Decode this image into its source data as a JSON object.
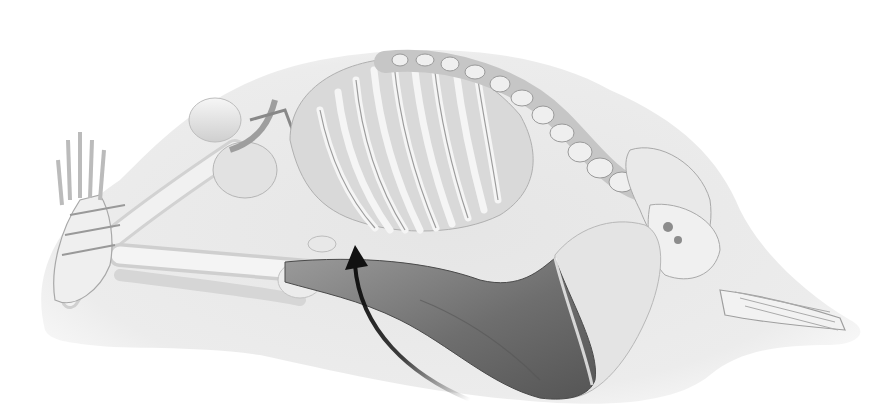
{
  "illustration": {
    "subject": "skeleton in seated forward fold",
    "highlighted_structure": "hamstring muscle group",
    "annotation": "curved-arrow",
    "colors": {
      "background": "#ffffff",
      "halo": "#e6e6e6",
      "bone": "#eeeeee",
      "bone_shadow": "#bdbdbd",
      "muscle": "#7a7a7a",
      "muscle_dark": "#5e5e5e",
      "arrow": "#111111"
    }
  }
}
